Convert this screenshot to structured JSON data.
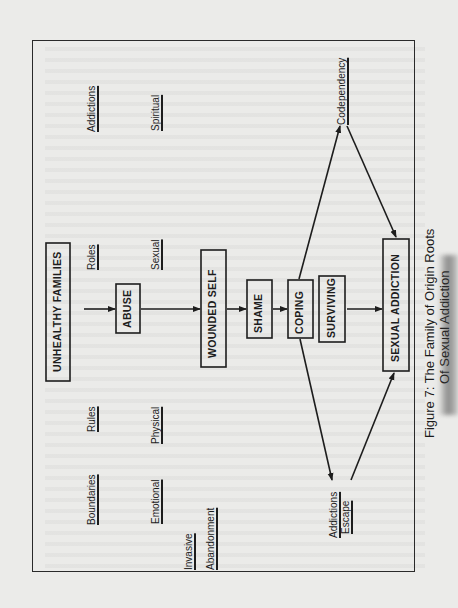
{
  "figure": {
    "caption_line1": "Figure 7: The Family of Origin Roots",
    "caption_line2": "Of Sexual Addiction",
    "orientation": "rotated-90-ccw"
  },
  "boxes": {
    "unhealthy_families": "UNHEALTHY FAMILIES",
    "abuse": "ABUSE",
    "wounded_self": "WOUNDED SELF",
    "shame": "SHAME",
    "coping": "COPING",
    "surviving": "SURVIVING",
    "sexual_addiction": "SEXUAL ADDICTION"
  },
  "family_traits": {
    "boundaries": "Boundaries",
    "rules": "Rules",
    "roles": "Roles",
    "addictions": "Addictions"
  },
  "abuse_types": {
    "emotional": "Emotional",
    "physical": "Physical",
    "sexual": "Sexual",
    "spiritual": "Spiritual"
  },
  "abuse_modes": {
    "invasive": "Invasive",
    "abandonment": "Abandonment"
  },
  "outcomes": {
    "codependency": "Codependency",
    "addictions_escape_line1": "Addictions",
    "addictions_escape_line2": "Escape"
  },
  "colors": {
    "ink": "#1d1d1d",
    "paper": "#ebebe9"
  }
}
